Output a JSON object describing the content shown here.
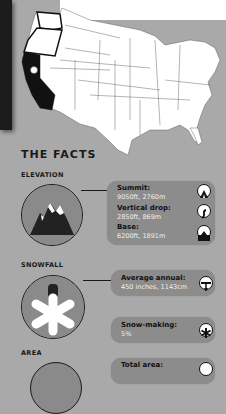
{
  "heading": "THE FACTS",
  "sections": {
    "elevation": {
      "label": "ELEVATION",
      "stats": [
        {
          "label": "Summit:",
          "value": "9050ft, 2760m",
          "icon": "summit-icon"
        },
        {
          "label": "Vertical drop:",
          "value": "2850ft, 869m",
          "icon": "vertical-drop-icon"
        },
        {
          "label": "Base:",
          "value": "6200ft, 1891m",
          "icon": "base-icon"
        }
      ]
    },
    "snowfall": {
      "label": "SNOWFALL",
      "stats": [
        {
          "label": "Average annual:",
          "value": "450 inches, 1143cm",
          "icon": "snow-depth-icon"
        },
        {
          "label": "Snow-making:",
          "value": "5%",
          "icon": "snowflake-icon"
        }
      ]
    },
    "area": {
      "label": "AREA",
      "stats": [
        {
          "label": "Total area:",
          "value": "",
          "icon": "area-icon"
        }
      ]
    }
  },
  "map": {
    "highlighted_state": "California",
    "outlined_states": [
      "Washington",
      "Oregon"
    ],
    "marker": "resort-location"
  }
}
